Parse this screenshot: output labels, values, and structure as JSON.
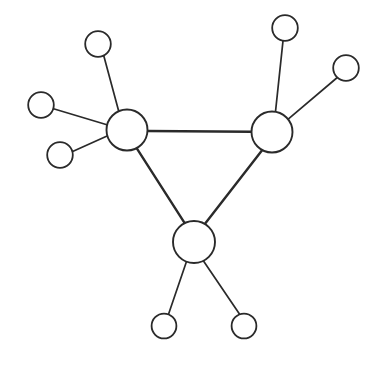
{
  "diagram": {
    "type": "node-link-graph",
    "canvas": {
      "width": 386,
      "height": 366,
      "background": "#ffffff"
    },
    "style": {
      "stroke_color": "#2a2a2a",
      "node_fill": "#ffffff",
      "hub_stroke_width": 1.9,
      "leaf_stroke_width": 1.8,
      "core_edge_width": 2.4,
      "spoke_edge_width": 1.7
    },
    "counts": {
      "total_nodes": 10,
      "hub_nodes": 3,
      "leaf_nodes": 7,
      "total_edges": 10,
      "core_edges": 3,
      "spoke_edges": 7
    },
    "nodes": [
      {
        "id": "hub-left",
        "role": "hub",
        "cx": 127,
        "cy": 130,
        "r": 20.5,
        "degree": 5
      },
      {
        "id": "hub-right",
        "role": "hub",
        "cx": 272,
        "cy": 132,
        "r": 20.5,
        "degree": 4
      },
      {
        "id": "hub-bottom",
        "role": "hub",
        "cx": 194,
        "cy": 242,
        "r": 21.0,
        "degree": 4
      },
      {
        "id": "leaf-top-left",
        "role": "leaf",
        "cx": 98,
        "cy": 44,
        "r": 12.8,
        "degree": 1
      },
      {
        "id": "leaf-left-upper",
        "role": "leaf",
        "cx": 41,
        "cy": 105,
        "r": 12.8,
        "degree": 1
      },
      {
        "id": "leaf-left-lower",
        "role": "leaf",
        "cx": 60,
        "cy": 155,
        "r": 12.8,
        "degree": 1
      },
      {
        "id": "leaf-top-right",
        "role": "leaf",
        "cx": 285,
        "cy": 28,
        "r": 12.8,
        "degree": 1
      },
      {
        "id": "leaf-right-upper",
        "role": "leaf",
        "cx": 346,
        "cy": 68,
        "r": 12.8,
        "degree": 1
      },
      {
        "id": "leaf-bottom-left",
        "role": "leaf",
        "cx": 164,
        "cy": 326,
        "r": 12.4,
        "degree": 1
      },
      {
        "id": "leaf-bottom-right",
        "role": "leaf",
        "cx": 244,
        "cy": 326,
        "r": 12.4,
        "degree": 1
      }
    ],
    "edges": [
      {
        "id": "edge-hubleft-hubright",
        "kind": "core",
        "from": "hub-left",
        "to": "hub-right",
        "x1": 147.5,
        "y1": 131.0,
        "x2": 251.5,
        "y2": 131.7
      },
      {
        "id": "edge-hubleft-hubbottom",
        "kind": "core",
        "from": "hub-left",
        "to": "hub-bottom",
        "x1": 136.8,
        "y1": 148.3,
        "x2": 184.7,
        "y2": 223.2
      },
      {
        "id": "edge-hubright-hubbottom",
        "kind": "core",
        "from": "hub-right",
        "to": "hub-bottom",
        "x1": 262.1,
        "y1": 150.2,
        "x2": 205.0,
        "y2": 223.8
      },
      {
        "id": "edge-hubleft-topleft",
        "kind": "spoke",
        "from": "hub-left",
        "to": "leaf-top-left",
        "x1": 118.8,
        "y1": 111.5,
        "x2": 103.7,
        "y2": 55.5
      },
      {
        "id": "edge-hubleft-leftupper",
        "kind": "spoke",
        "from": "hub-left",
        "to": "leaf-left-upper",
        "x1": 106.9,
        "y1": 124.7,
        "x2": 53.5,
        "y2": 108.7
      },
      {
        "id": "edge-hubleft-leftlower",
        "kind": "spoke",
        "from": "hub-left",
        "to": "leaf-left-lower",
        "x1": 107.1,
        "y1": 136.0,
        "x2": 72.6,
        "y2": 151.5
      },
      {
        "id": "edge-hubright-topright",
        "kind": "spoke",
        "from": "hub-right",
        "to": "leaf-top-right",
        "x1": 275.5,
        "y1": 111.7,
        "x2": 283.0,
        "y2": 40.8
      },
      {
        "id": "edge-hubright-rightup",
        "kind": "spoke",
        "from": "hub-right",
        "to": "leaf-right-upper",
        "x1": 288.2,
        "y1": 119.1,
        "x2": 337.3,
        "y2": 77.5
      },
      {
        "id": "edge-hubbottom-botleft",
        "kind": "spoke",
        "from": "hub-bottom",
        "to": "leaf-bottom-left",
        "x1": 186.5,
        "y1": 261.5,
        "x2": 168.5,
        "y2": 314.3
      },
      {
        "id": "edge-hubbottom-botright",
        "kind": "spoke",
        "from": "hub-bottom",
        "to": "leaf-bottom-right",
        "x1": 203.5,
        "y1": 261.0,
        "x2": 239.8,
        "y2": 314.5
      }
    ]
  }
}
